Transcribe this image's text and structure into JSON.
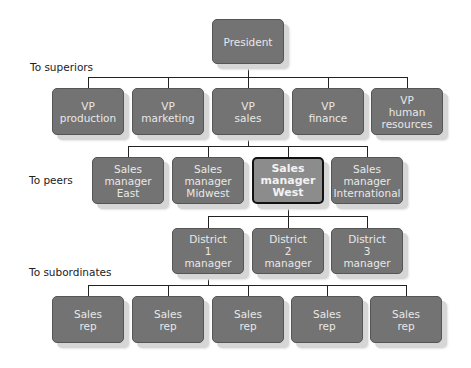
{
  "labels": {
    "superiors": "To superiors",
    "peers": "To peers",
    "subordinates": "To subordinates"
  },
  "president": "President",
  "vps": [
    "VP\nproduction",
    "VP\nmarketing",
    "VP\nsales",
    "VP\nfinance",
    "VP\nhuman\nresources"
  ],
  "sales_managers": [
    "Sales\nmanager\nEast",
    "Sales\nmanager\nMidwest",
    "Sales\nmanager\nWest",
    "Sales\nmanager\nInternational"
  ],
  "districts": [
    "District\n1\nmanager",
    "District\n2\nmanager",
    "District\n3\nmanager"
  ],
  "reps": [
    "Sales\nrep",
    "Sales\nrep",
    "Sales\nrep",
    "Sales\nrep",
    "Sales\nrep"
  ],
  "colors": {
    "node": "#737373",
    "highlight": "#8c8c8c",
    "highlight_border": "#111111"
  }
}
